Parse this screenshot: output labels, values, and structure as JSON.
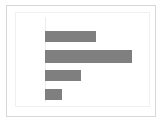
{
  "card": {
    "border_color": "#d7d7d7",
    "background": "#ffffff"
  },
  "plot": {
    "frame_color": "#f0f0f0",
    "axis_line_color": "#ececec",
    "bar_color": "#7f7f7f"
  },
  "chart_data": {
    "type": "bar",
    "orientation": "horizontal",
    "title": "",
    "subtitle": "",
    "xlabel": "",
    "ylabel": "",
    "categories": [
      "",
      "",
      "",
      ""
    ],
    "values": [
      27,
      46,
      19,
      9
    ],
    "bar_labels": [
      "",
      "",
      "",
      ""
    ],
    "xlim": [
      0,
      55
    ],
    "ylim": [
      0,
      4
    ],
    "xticks": [],
    "yticks": [],
    "xticklabels": [],
    "yticklabels": [],
    "grid": false,
    "legend": false,
    "legend_position": "none",
    "annotations": [],
    "series": [
      {
        "name": "",
        "values": [
          27,
          46,
          19,
          9
        ],
        "color": "#7f7f7f"
      }
    ]
  }
}
